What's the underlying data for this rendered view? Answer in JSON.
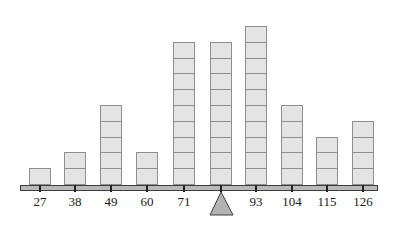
{
  "diagram": {
    "type": "dot-plot-balance",
    "colors": {
      "block_fill": "#e4e4e4",
      "block_border": "#8e8e8e",
      "beam_fill": "#b9b9b9",
      "beam_border": "#3c3c3c",
      "fulcrum_fill": "#b3b3b3"
    },
    "fulcrum_position": 82,
    "columns": [
      {
        "value": 27,
        "label": "27",
        "count": 1,
        "x": 40
      },
      {
        "value": 38,
        "label": "38",
        "count": 2,
        "x": 75
      },
      {
        "value": 49,
        "label": "49",
        "count": 5,
        "x": 111
      },
      {
        "value": 60,
        "label": "60",
        "count": 2,
        "x": 147
      },
      {
        "value": 71,
        "label": "71",
        "count": 9,
        "x": 184
      },
      {
        "value": 82,
        "label": "",
        "count": 9,
        "x": 221
      },
      {
        "value": 93,
        "label": "93",
        "count": 10,
        "x": 256
      },
      {
        "value": 104,
        "label": "104",
        "count": 5,
        "x": 292
      },
      {
        "value": 115,
        "label": "115",
        "count": 3,
        "x": 327
      },
      {
        "value": 126,
        "label": "126",
        "count": 4,
        "x": 363
      }
    ]
  },
  "chart_data": {
    "type": "bar",
    "categories": [
      "27",
      "38",
      "49",
      "60",
      "71",
      "82",
      "93",
      "104",
      "115",
      "126"
    ],
    "values": [
      1,
      2,
      5,
      2,
      9,
      9,
      10,
      5,
      3,
      4
    ],
    "title": "",
    "xlabel": "",
    "ylabel": "",
    "balance_point": 82
  }
}
